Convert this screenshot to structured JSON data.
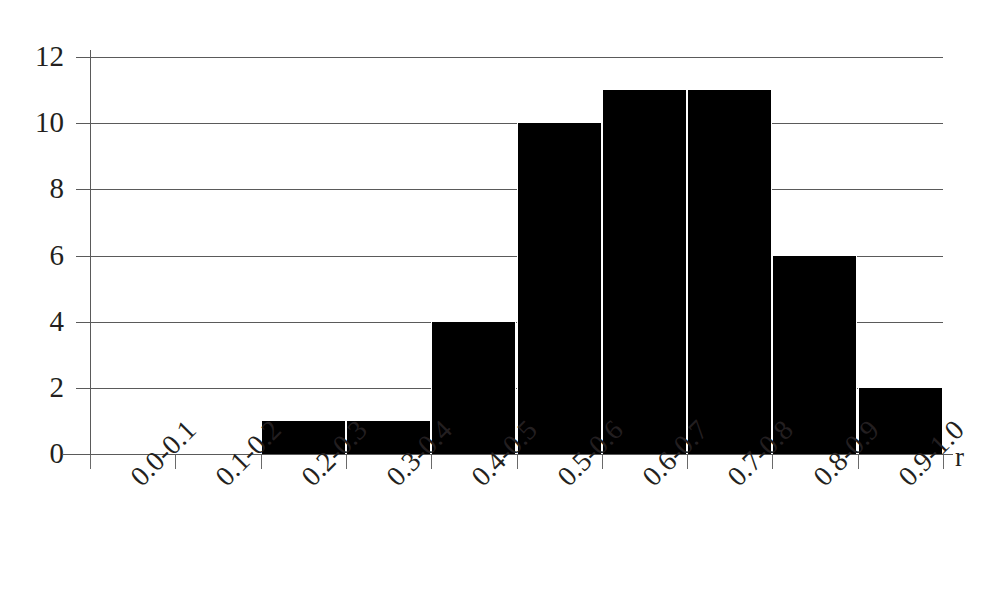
{
  "chart_data": {
    "type": "bar",
    "title": "",
    "subtitle": "",
    "xlabel": "r",
    "ylabel": "",
    "categories": [
      "0.0-0.1",
      "0.1-0.2",
      "0.2-0.3",
      "0.3-0.4",
      "0.4-0.5",
      "0.5-0.6",
      "0.6-0.7",
      "0.7-0.8",
      "0.8-0.9",
      "0.9-1.0"
    ],
    "values": [
      0,
      0,
      1,
      1,
      4,
      10,
      11,
      11,
      6,
      2
    ],
    "ylim": [
      0,
      12
    ],
    "yticks": [
      0,
      2,
      4,
      6,
      8,
      10,
      12
    ],
    "ytick_labels": [
      "0",
      "2",
      "4",
      "6",
      "8",
      "10",
      "12"
    ],
    "grid": "horizontal",
    "legend": "none",
    "bar_color": "#000000",
    "axis_color": "#5a5a5a",
    "text_color": "#231f20",
    "background": "#ffffff",
    "annotations": []
  }
}
